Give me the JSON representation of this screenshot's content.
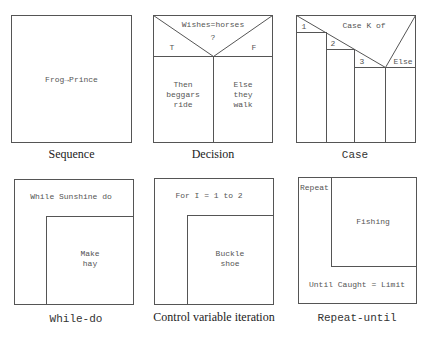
{
  "diagrams": {
    "sequence": {
      "caption": "Sequence",
      "body": "Frog→Prince"
    },
    "decision": {
      "caption": "Decision",
      "condition": "Wishes=horses",
      "question": "?",
      "true_label": "T",
      "false_label": "F",
      "then_lines": [
        "Then",
        "beggars",
        "ride"
      ],
      "else_lines": [
        "Else",
        "they",
        "walk"
      ]
    },
    "case": {
      "caption": "Case",
      "header": "Case K of",
      "options": [
        "1",
        "2",
        "3",
        "Else"
      ]
    },
    "while_do": {
      "caption": "While-do",
      "condition": "While Sunshine do",
      "body_lines": [
        "Make",
        "hay"
      ]
    },
    "control_variable": {
      "caption": "Control variable iteration",
      "condition": "For I = 1 to 2",
      "body_lines": [
        "Buckle",
        "shoe"
      ]
    },
    "repeat_until": {
      "caption": "Repeat-until",
      "keyword": "Repeat",
      "body": "Fishing",
      "condition": "Until Caught = Limit"
    }
  },
  "colors": {
    "line": "#555555",
    "text": "#555555",
    "caption": "#222222",
    "background": "#ffffff"
  }
}
